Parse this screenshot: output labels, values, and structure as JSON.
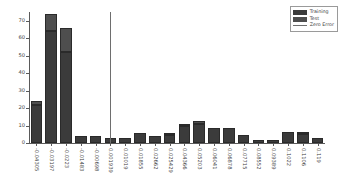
{
  "chart_data": {
    "type": "bar",
    "title": "",
    "xlabel": "",
    "ylabel": "",
    "ylim": [
      0,
      75
    ],
    "yticks": [
      0,
      10,
      20,
      30,
      40,
      50,
      60,
      70
    ],
    "grid": false,
    "stacked": true,
    "legend_position": "upper right",
    "categories": [
      "-0.04305",
      "-0.03197",
      "-0.0223",
      "-0.01483",
      "-0.00698",
      "0.001939",
      "0.01019",
      "0.01855",
      "0.02662",
      "0.025429",
      "0.04366",
      "0.05203",
      "0.06041",
      "0.06878",
      "0.07715",
      "0.08552",
      "0.09389",
      "0.1022",
      "0.1106",
      "0.119"
    ],
    "series": [
      {
        "name": "Training",
        "color": "#3b3b3b",
        "values": [
          22,
          64,
          52,
          4,
          4,
          3,
          3,
          6,
          4,
          4.5,
          10,
          11,
          8.5,
          8.5,
          4.5,
          2,
          2,
          6.5,
          5,
          3
        ]
      },
      {
        "name": "Test",
        "color": "#4e4e4e",
        "values": [
          2,
          10,
          14,
          0,
          0,
          0,
          0,
          0,
          0,
          1.5,
          0.5,
          1.5,
          0,
          0,
          0,
          0,
          0,
          0,
          1.5,
          0
        ]
      }
    ],
    "totals": [
      24,
      74,
      66,
      4,
      4,
      3,
      3,
      6,
      4,
      6,
      10.5,
      12.5,
      8.5,
      8.5,
      4.5,
      2,
      2,
      6.5,
      6.5,
      3
    ],
    "reference_line": {
      "name": "Zero Error",
      "orientation": "vertical",
      "value": 0,
      "color": "#6e6e6e",
      "position_index": 5.5
    }
  },
  "legend": {
    "items": [
      {
        "label": "Training",
        "kind": "swatch",
        "color": "#3b3b3b"
      },
      {
        "label": "Test",
        "kind": "swatch",
        "color": "#4e4e4e"
      },
      {
        "label": "Zero Error",
        "kind": "line",
        "color": "#6e6e6e"
      }
    ]
  },
  "axis": {
    "tick_color": "#5a5a5a",
    "label_color": "#3d3d3d"
  }
}
